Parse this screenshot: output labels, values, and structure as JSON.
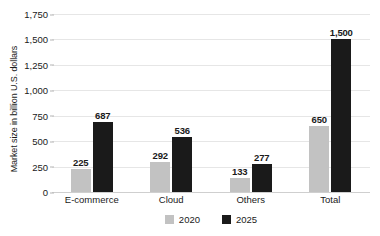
{
  "chart_data": {
    "type": "bar",
    "title": "",
    "subtitle": "",
    "xlabel": "",
    "ylabel": "Market size in billion U.S. dollars",
    "ylim": [
      0,
      1750
    ],
    "ytick_labels": [
      "0",
      "250",
      "500",
      "750",
      "1,000",
      "1,250",
      "1,500",
      "1,750"
    ],
    "ytick_values": [
      0,
      250,
      500,
      750,
      1000,
      1250,
      1500,
      1750
    ],
    "grid": true,
    "legend_position": "bottom-center",
    "categories": [
      "E-commerce",
      "Cloud",
      "Others",
      "Total"
    ],
    "series": [
      {
        "name": "2020",
        "color": "#c2c2c2",
        "values": [
          225,
          292,
          133,
          650
        ],
        "labels": [
          "225",
          "292",
          "133",
          "650"
        ]
      },
      {
        "name": "2025",
        "color": "#1a1a1a",
        "values": [
          687,
          536,
          277,
          1500
        ],
        "labels": [
          "687",
          "536",
          "277",
          "1,500"
        ]
      }
    ]
  },
  "legend": {
    "items": [
      {
        "label": "2020",
        "color": "#c2c2c2"
      },
      {
        "label": "2025",
        "color": "#1a1a1a"
      }
    ]
  },
  "colors": {
    "series_2020": "#c2c2c2",
    "series_2025": "#1a1a1a",
    "gridline": "#e6e6e6",
    "background": "#ffffff",
    "text": "#1a1a1a"
  }
}
